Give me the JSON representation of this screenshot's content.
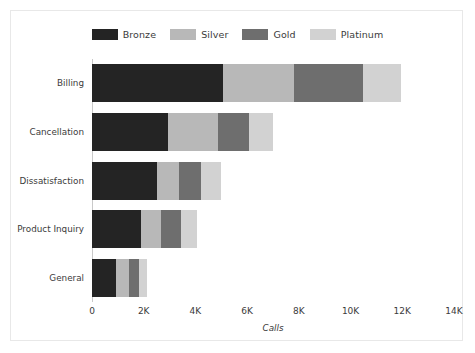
{
  "chart_data": {
    "type": "bar",
    "orientation": "horizontal",
    "stacked": true,
    "title": "",
    "xlabel": "Calls",
    "ylabel": "",
    "xlim": [
      0,
      14000
    ],
    "xticks": [
      0,
      2000,
      4000,
      6000,
      8000,
      10000,
      12000,
      14000
    ],
    "xticklabels": [
      "0",
      "2K",
      "4K",
      "6K",
      "8K",
      "10K",
      "12K",
      "14K"
    ],
    "grid": false,
    "legend_position": "top-center",
    "categories": [
      "Billing",
      "Cancellation",
      "Dissatisfaction",
      "Product Inquiry",
      "General"
    ],
    "series": [
      {
        "name": "Bronze",
        "color": "#242424",
        "values": [
          5070,
          2940,
          2510,
          1900,
          930
        ]
      },
      {
        "name": "Silver",
        "color": "#b8b8b8",
        "values": [
          2750,
          1930,
          870,
          770,
          500
        ]
      },
      {
        "name": "Gold",
        "color": "#6e6e6e",
        "values": [
          2670,
          1200,
          830,
          770,
          390
        ]
      },
      {
        "name": "Platinum",
        "color": "#d2d2d2",
        "values": [
          1470,
          930,
          790,
          620,
          310
        ]
      }
    ],
    "totals": [
      11960,
      7000,
      5000,
      4060,
      2130
    ]
  },
  "legend": {
    "items": [
      {
        "label": "Bronze"
      },
      {
        "label": "Silver"
      },
      {
        "label": "Gold"
      },
      {
        "label": "Platinum"
      }
    ]
  },
  "axes": {
    "x_title": "Calls"
  },
  "colors": {
    "background": "#ffffff",
    "border": "#e8e8e8",
    "axis": "#c9c9c9",
    "text": "#3b3b3b"
  }
}
